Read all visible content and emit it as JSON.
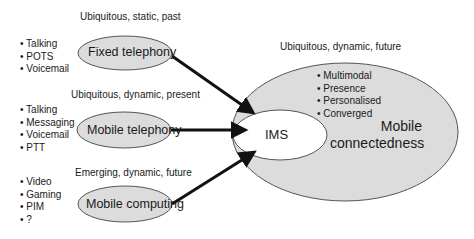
{
  "diagram": {
    "sources": [
      {
        "caption": "Ubiquitous, static, past",
        "node": "Fixed telephony",
        "bullets": [
          "• Talking",
          "• POTS",
          "• Voicemail"
        ]
      },
      {
        "caption": "Ubiquitous, dynamic, present",
        "node": "Mobile telephony",
        "bullets": [
          "• Talking",
          "• Messaging",
          "• Voicemail",
          "• PTT"
        ]
      },
      {
        "caption": "Emerging, dynamic, future",
        "node": "Mobile computing",
        "bullets": [
          "• Video",
          "• Gaming",
          "• PIM",
          "• ?"
        ]
      }
    ],
    "target": {
      "caption": "Ubiquitous, dynamic, future",
      "inner": "IMS",
      "title_line1": "Mobile",
      "title_line2": "connectedness",
      "bullets": [
        "• Multimodal",
        "• Presence",
        "• Personalised",
        "• Converged"
      ]
    },
    "colors": {
      "fill": "#dcdcdc",
      "stroke": "#555555",
      "arrow": "#111111"
    }
  }
}
